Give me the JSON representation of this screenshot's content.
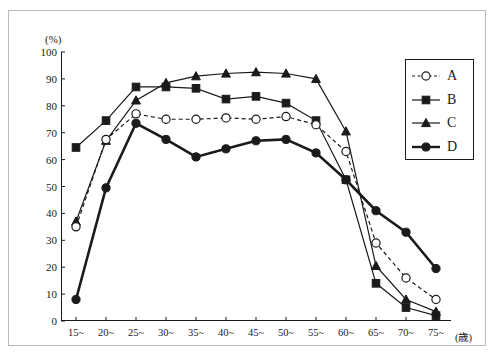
{
  "chart_data": {
    "type": "line",
    "title": "",
    "xlabel": "(歳)",
    "ylabel": "(%)",
    "x_unit": "(歳)",
    "y_unit": "(%)",
    "categories": [
      "15~",
      "20~",
      "25~",
      "30~",
      "35~",
      "40~",
      "45~",
      "50~",
      "55~",
      "60~",
      "65~",
      "70~",
      "75~"
    ],
    "ylim": [
      0,
      100
    ],
    "ytick_labels": [
      "0",
      "10",
      "20",
      "30",
      "40",
      "50",
      "60",
      "70",
      "80",
      "90",
      "100"
    ],
    "ytick_values": [
      0,
      10,
      20,
      30,
      40,
      50,
      60,
      70,
      80,
      90,
      100
    ],
    "grid": false,
    "legend_position": "top-right",
    "series": [
      {
        "name": "A",
        "marker": "open-circle",
        "line_style": "dashed",
        "color": "#1a1a1a",
        "values": [
          35,
          67.5,
          77,
          75,
          75,
          75.5,
          75,
          76,
          73,
          63,
          29,
          16,
          8
        ]
      },
      {
        "name": "B",
        "marker": "filled-square",
        "line_style": "solid",
        "color": "#1a1a1a",
        "values": [
          64.5,
          74.5,
          87,
          87,
          86.5,
          82.5,
          83.5,
          81,
          74.5,
          52.5,
          14,
          5,
          2
        ]
      },
      {
        "name": "C",
        "marker": "filled-triangle",
        "line_style": "solid",
        "color": "#1a1a1a",
        "values": [
          37,
          67,
          82,
          88.5,
          91,
          92,
          92.5,
          92,
          90,
          70.5,
          20.5,
          8,
          3.5
        ]
      },
      {
        "name": "D",
        "marker": "filled-circle",
        "line_style": "solid-thick",
        "color": "#1a1a1a",
        "values": [
          8,
          49.5,
          73.5,
          67.5,
          61,
          64,
          67,
          67.5,
          62.5,
          52.5,
          41,
          33,
          19.5
        ]
      }
    ]
  },
  "legend": {
    "items": [
      {
        "label": "A"
      },
      {
        "label": "B"
      },
      {
        "label": "C"
      },
      {
        "label": "D"
      }
    ]
  }
}
